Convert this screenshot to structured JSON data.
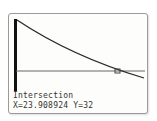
{
  "calculator": {
    "mode": "graph",
    "graph": {
      "curve": "decreasing exponential",
      "horizontal_line_y": 32,
      "intersection_marker": "cursor"
    },
    "prompt_label": "Intersection",
    "x_readout": "X=23.908924",
    "y_readout": "Y=32",
    "colors": {
      "curve": "#2a2a2a",
      "axis": "#111111",
      "line": "#555555"
    }
  }
}
